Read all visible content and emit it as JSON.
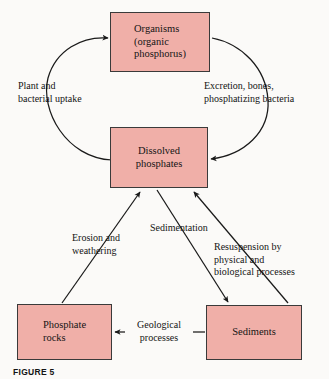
{
  "figure": {
    "caption": "FIGURE 5",
    "background_color": "#fbfaf8",
    "box_fill_color": "#f0afa8",
    "box_border_color": "#3a3a3a",
    "arrow_color": "#1a1a1a"
  },
  "nodes": [
    {
      "id": "organisms",
      "label": "Organisms\n(organic\nphosphorus)"
    },
    {
      "id": "dissolved-phosphates",
      "label": "Dissolved\nphosphates"
    },
    {
      "id": "phosphate-rocks",
      "label": "Phosphate\nrocks"
    },
    {
      "id": "sediments",
      "label": "Sediments"
    }
  ],
  "edges": [
    {
      "id": "plant-uptake",
      "label": "Plant and\nbacterial uptake",
      "from": "dissolved-phosphates",
      "to": "organisms",
      "style": "curved"
    },
    {
      "id": "excretion",
      "label": "Excretion, bones,\nphosphatizing bacteria",
      "from": "organisms",
      "to": "dissolved-phosphates",
      "style": "curved"
    },
    {
      "id": "erosion",
      "label": "Erosion and\nweathering",
      "from": "phosphate-rocks",
      "to": "dissolved-phosphates",
      "style": "straight"
    },
    {
      "id": "sedimentation",
      "label": "Sedimentation",
      "from": "dissolved-phosphates",
      "to": "sediments",
      "style": "straight"
    },
    {
      "id": "resuspension",
      "label": "Resuspension by\nphysical and\nbiological processes",
      "from": "sediments",
      "to": "dissolved-phosphates",
      "style": "straight"
    },
    {
      "id": "geological",
      "label": "Geological\nprocesses",
      "from": "sediments",
      "to": "phosphate-rocks",
      "style": "straight"
    }
  ]
}
